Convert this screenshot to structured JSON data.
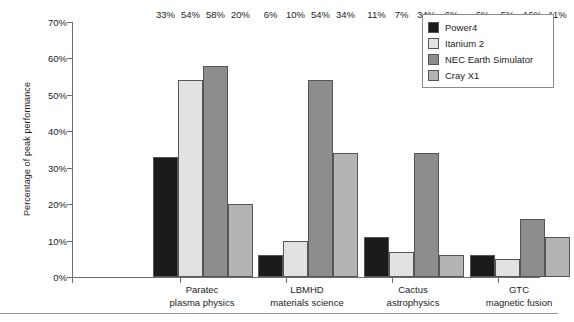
{
  "chart_data": {
    "type": "bar",
    "title": "",
    "xlabel": "",
    "ylabel": "Percentage of peak performance",
    "ylim": [
      0,
      70
    ],
    "grid": false,
    "legend_position": "top-right",
    "ytick_labels": [
      "70%",
      "60%",
      "50%",
      "40%",
      "30%",
      "20%",
      "10%",
      "0%"
    ],
    "ytick_values": [
      70,
      60,
      50,
      40,
      30,
      20,
      10,
      0
    ],
    "categories": [
      {
        "line1": "Paratec",
        "line2": "plasma physics"
      },
      {
        "line1": "LBMHD",
        "line2": "materials science"
      },
      {
        "line1": "Cactus",
        "line2": "astrophysics"
      },
      {
        "line1": "GTC",
        "line2": "magnetic fusion"
      }
    ],
    "series": [
      {
        "name": "Power4",
        "color": "#1a1a1a",
        "values": [
          33,
          6,
          11,
          6
        ],
        "labels": [
          "33%",
          "6%",
          "11%",
          "6%"
        ]
      },
      {
        "name": "Itanium 2",
        "color": "#e2e2e2",
        "values": [
          54,
          10,
          7,
          5
        ],
        "labels": [
          "54%",
          "10%",
          "7%",
          "5%"
        ]
      },
      {
        "name": "NEC Earth Simulator",
        "color": "#8d8d8d",
        "values": [
          58,
          54,
          34,
          16
        ],
        "labels": [
          "58%",
          "54%",
          "34%",
          "16%"
        ]
      },
      {
        "name": "Cray X1",
        "color": "#b4b4b4",
        "values": [
          20,
          34,
          6,
          11
        ],
        "labels": [
          "20%",
          "34%",
          "6%",
          "11%"
        ]
      }
    ]
  },
  "legend": {
    "items": [
      {
        "label": "Power4",
        "color": "#1a1a1a"
      },
      {
        "label": "Itanium 2",
        "color": "#e2e2e2"
      },
      {
        "label": "NEC Earth Simulator",
        "color": "#8d8d8d"
      },
      {
        "label": "Cray X1",
        "color": "#b4b4b4"
      }
    ]
  }
}
